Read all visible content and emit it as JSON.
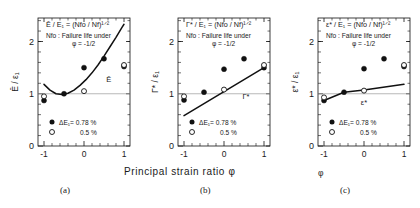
{
  "figure": {
    "xlabel": "Principal strain ratio  φ",
    "captions": [
      "(a)",
      "(b)",
      "(c)"
    ],
    "legend": {
      "filled_label": "ΔE₁= 0.78  %",
      "open_label": "0.5   %"
    },
    "note_line2": "Nfo : Failure life under",
    "note_line3": "φ = -1/2",
    "xticks": [
      "-1",
      "0",
      "1"
    ],
    "xtick_values": [
      -1,
      0,
      1
    ],
    "yticks": [
      "0",
      "1",
      "2"
    ],
    "ytick_values": [
      0,
      1,
      2
    ],
    "xlim": [
      -1.15,
      1.15
    ],
    "ylim": [
      0,
      2.45
    ]
  },
  "chart_data": [
    {
      "type": "scatter",
      "panel": "(a)",
      "title": "Ē / E₁ = (Nfo / Nf)¹ᐟ²",
      "title_plain": "E / E1 = (Nfo / Nf)^(1/2)",
      "ylabel": "Ē / ε₁",
      "xlabel": "φ",
      "curve_label": "Ē",
      "curve_label_x": 0.62,
      "curve_label_y": 1.22,
      "ref_line_y": 1.0,
      "xlim": [
        -1.15,
        1.15
      ],
      "ylim": [
        0,
        2.45
      ],
      "series": [
        {
          "name": "ΔE₁ = 0.78 %",
          "marker": "filled-circle",
          "x": [
            -1,
            -0.5,
            0,
            0.5,
            1
          ],
          "values": [
            0.87,
            1.0,
            1.5,
            1.67,
            1.52
          ]
        },
        {
          "name": "ΔE₁ = 0.5 %",
          "marker": "open-circle",
          "x": [
            -1,
            0,
            1
          ],
          "values": [
            0.95,
            1.05,
            1.55
          ]
        }
      ],
      "fit": {
        "shape": "parabola",
        "x": [
          -1,
          -0.85,
          -0.7,
          -0.55,
          -0.4,
          -0.25,
          -0.1,
          0.05,
          0.2,
          0.35,
          0.5,
          0.65,
          0.8,
          0.95,
          1.0
        ],
        "y": [
          1.18,
          1.07,
          1.0,
          0.985,
          1.01,
          1.07,
          1.16,
          1.27,
          1.4,
          1.55,
          1.72,
          1.9,
          2.08,
          2.27,
          2.33
        ]
      }
    },
    {
      "type": "scatter",
      "panel": "(b)",
      "title": "Γ* / E₁ = (Nfo / Nf)¹ᐟ²",
      "title_plain": "G* / E1 = (Nfo / Nf)^(1/2)",
      "ylabel": "Γ* / ε₁",
      "xlabel": "φ",
      "curve_label": "Γ*",
      "curve_label_x": 0.55,
      "curve_label_y": 0.9,
      "ref_line_y": 1.0,
      "xlim": [
        -1.15,
        1.15
      ],
      "ylim": [
        0,
        2.45
      ],
      "series": [
        {
          "name": "ΔE₁ = 0.78 %",
          "marker": "filled-circle",
          "x": [
            -1,
            -0.5,
            0,
            0.5,
            1
          ],
          "values": [
            0.88,
            1.03,
            1.47,
            1.67,
            1.5
          ]
        },
        {
          "name": "ΔE₁ = 0.5 %",
          "marker": "open-circle",
          "x": [
            -1,
            0,
            1
          ],
          "values": [
            0.95,
            1.08,
            1.55
          ]
        }
      ],
      "fit": {
        "shape": "line",
        "x": [
          -1,
          1
        ],
        "y": [
          0.58,
          1.5
        ]
      }
    },
    {
      "type": "scatter",
      "panel": "(c)",
      "title": "ε* / E₁ = (Nfo / Nf)¹ᐟ²",
      "title_plain": "e* / E1 = (Nfo / Nf)^(1/2)",
      "ylabel": "ε* / ε₁",
      "xlabel": "φ",
      "curve_label": "ε*",
      "curve_label_x": 0.0,
      "curve_label_y": 0.78,
      "ref_line_y": 1.0,
      "xlim": [
        -1.15,
        1.15
      ],
      "ylim": [
        0,
        2.45
      ],
      "series": [
        {
          "name": "ΔE₁ = 0.78 %",
          "marker": "filled-circle",
          "x": [
            -1,
            -0.5,
            0,
            0.5,
            1
          ],
          "values": [
            0.87,
            1.03,
            1.48,
            1.67,
            1.52
          ]
        },
        {
          "name": "ΔE₁ = 0.5 %",
          "marker": "open-circle",
          "x": [
            -1,
            0,
            1
          ],
          "values": [
            0.93,
            1.06,
            1.55
          ]
        }
      ],
      "fit": {
        "shape": "polyline",
        "x": [
          -1,
          -0.5,
          0,
          1
        ],
        "y": [
          0.87,
          1.03,
          1.07,
          1.18
        ]
      }
    }
  ]
}
